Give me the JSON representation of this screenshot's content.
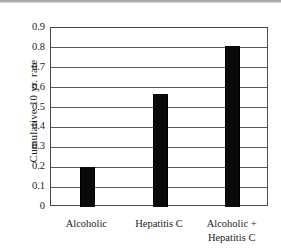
{
  "chart_data": {
    "type": "bar",
    "title": "",
    "subtitle": "",
    "xlabel": "",
    "ylabel": "Cumulative 10 yr. rate",
    "categories": [
      "Alcoholic",
      "Hepatitis C",
      "Alcoholic + Hepatitis C"
    ],
    "category_lines": [
      [
        "Alcoholic"
      ],
      [
        "Hepatitis C"
      ],
      [
        "Alcoholic +",
        "Hepatitis C"
      ]
    ],
    "values": [
      0.2,
      0.57,
      0.81
    ],
    "ylim": [
      0,
      0.9
    ],
    "ytick_values": [
      0.9,
      0.8,
      0.7,
      0.6,
      0.5,
      0.4,
      0.3,
      0.2,
      0.1,
      0
    ],
    "ytick_labels": [
      "0.9",
      "0.8",
      "0.7",
      "0.6",
      "0.5",
      "0.4",
      "0.3",
      "0.2",
      "0.1",
      "0"
    ],
    "grid": true,
    "legend": false,
    "legend_position": "none",
    "bar_color": "#0a0a0a",
    "frame_color": "#4a4a4a",
    "grid_color": "#5a5a5a",
    "background_color": "#ffffff"
  }
}
